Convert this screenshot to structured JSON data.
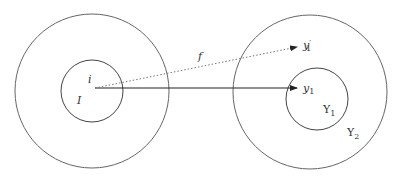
{
  "diagram": {
    "colors": {
      "stroke": "#555555",
      "text": "#333333",
      "background": "#ffffff"
    },
    "domain_set": {
      "outer_label": "",
      "inner_label": "I",
      "point_label": "i"
    },
    "codomain_set": {
      "outer_label": "Y",
      "outer_sub": "2",
      "inner_label": "Y",
      "inner_sub": "1",
      "point_label": "y",
      "point_sub": "1",
      "alt_point_label": "y",
      "alt_point_prime": "′",
      "alt_point_sub": "1"
    },
    "arrows": {
      "mapping_label": "f",
      "solid_arrow": "i → y1",
      "dotted_arrow": "i → y′1"
    }
  }
}
